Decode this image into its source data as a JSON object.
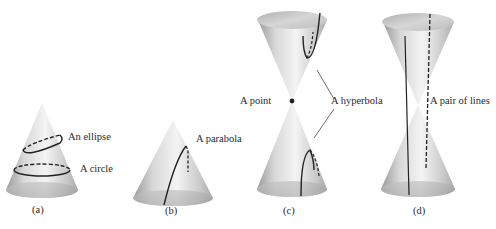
{
  "figure": {
    "panels": [
      {
        "id": "a",
        "caption": "(a)",
        "shape": "single cone",
        "labels": [
          "An ellipse",
          "A circle"
        ]
      },
      {
        "id": "b",
        "caption": "(b)",
        "shape": "single cone",
        "labels": [
          "A parabola"
        ]
      },
      {
        "id": "c",
        "caption": "(c)",
        "shape": "double cone",
        "labels": [
          "A point",
          "A hyperbola"
        ]
      },
      {
        "id": "d",
        "caption": "(d)",
        "shape": "double cone",
        "labels": [
          "A pair of lines"
        ]
      }
    ]
  }
}
